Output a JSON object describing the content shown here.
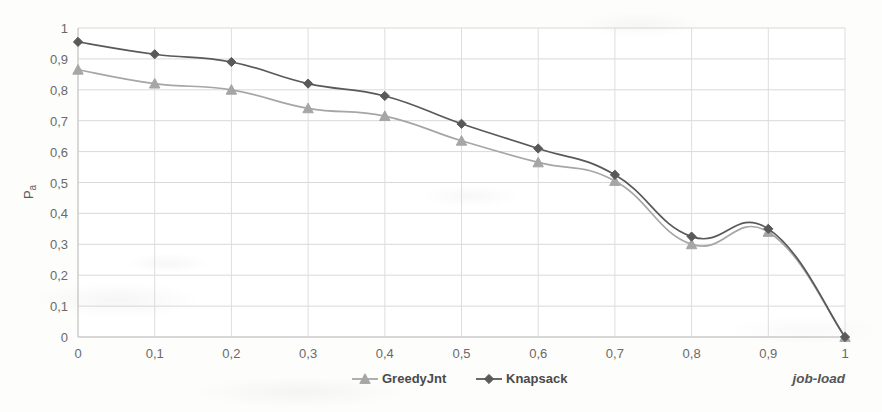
{
  "chart_data": {
    "type": "line",
    "title": "",
    "xlabel": "job-load",
    "ylabel": "Pa",
    "x": [
      0,
      0.1,
      0.2,
      0.3,
      0.4,
      0.5,
      0.6,
      0.7,
      0.8,
      0.9,
      1
    ],
    "xtick_labels": [
      "0",
      "0,1",
      "0,2",
      "0,3",
      "0,4",
      "0,5",
      "0,6",
      "0,7",
      "0,8",
      "0,9",
      "1"
    ],
    "ytick_labels": [
      "0",
      "0,1",
      "0,2",
      "0,3",
      "0,4",
      "0,5",
      "0,6",
      "0,7",
      "0,8",
      "0,9",
      "1"
    ],
    "ytick_values": [
      0,
      0.1,
      0.2,
      0.3,
      0.4,
      0.5,
      0.6,
      0.7,
      0.8,
      0.9,
      1
    ],
    "xlim": [
      0,
      1
    ],
    "ylim": [
      0,
      1
    ],
    "grid": true,
    "smoothing": true,
    "legend_position": "bottom",
    "series": [
      {
        "name": "GreedyJnt",
        "marker": "triangle",
        "color": "#a6a6a6",
        "values": [
          0.865,
          0.82,
          0.8,
          0.74,
          0.715,
          0.635,
          0.565,
          0.505,
          0.3,
          0.34,
          0.0
        ]
      },
      {
        "name": "Knapsack",
        "marker": "diamond",
        "color": "#595959",
        "values": [
          0.955,
          0.915,
          0.89,
          0.82,
          0.78,
          0.69,
          0.61,
          0.525,
          0.325,
          0.35,
          0.0
        ]
      }
    ]
  },
  "legend": {
    "items": [
      {
        "label": "GreedyJnt",
        "marker": "triangle",
        "color": "#a6a6a6"
      },
      {
        "label": "Knapsack",
        "marker": "diamond",
        "color": "#595959"
      }
    ]
  },
  "axes": {
    "y_title": "Pa",
    "y_title_base": "P",
    "y_title_sub": "a",
    "x_title": "job-load"
  },
  "colors": {
    "background": "#fdfdfc",
    "gridline": "#d9d9d9",
    "axis": "#c4c4c4",
    "series_greedy": "#a6a6a6",
    "series_knapsack": "#595959",
    "tick_text": "#6a6a6a"
  }
}
